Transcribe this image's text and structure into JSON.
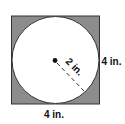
{
  "diagram": {
    "type": "square-with-inscribed-circle",
    "square": {
      "side_label": "4 in.",
      "bottom_label": "4 in.",
      "fill": "#8c8c8c",
      "stroke": "#333333"
    },
    "circle": {
      "radius_label": "2 in.",
      "fill": "#ffffff",
      "stroke": "#333333",
      "center_dot_color": "#111111"
    },
    "radius_line": {
      "style": "dashed",
      "direction": "down-right"
    }
  }
}
